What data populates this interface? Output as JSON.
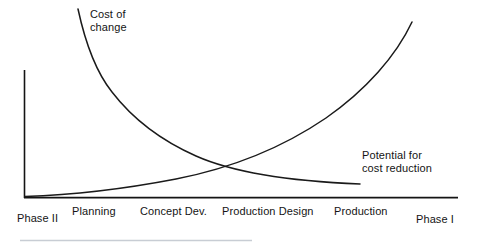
{
  "figure": {
    "width": 478,
    "height": 248,
    "background": "#ffffff",
    "line_color": "#1a1a1a",
    "axis_color": "#141414",
    "footer_rule_color": "#c8cdd4"
  },
  "annotations": {
    "cost_of_change": {
      "line1": "Cost of",
      "line2": "change"
    },
    "potential_cost_reduction": {
      "line1": "Potential for",
      "line2": "cost reduction"
    }
  },
  "axis": {
    "tick_labels": [
      {
        "label": "Phase II",
        "x": 17,
        "y": 212
      },
      {
        "label": "Planning",
        "x": 72,
        "y": 205
      },
      {
        "label": "Concept Dev.",
        "x": 140,
        "y": 205
      },
      {
        "label": "Production Design",
        "x": 222,
        "y": 205
      },
      {
        "label": "Production",
        "x": 334,
        "y": 205
      },
      {
        "label": "Phase I",
        "x": 416,
        "y": 213
      }
    ]
  },
  "chart_data": {
    "type": "line",
    "title": "",
    "subtitle": "",
    "xlabel": "",
    "ylabel": "",
    "grid": false,
    "legend": "inline-annotations",
    "xlim": [
      0,
      5
    ],
    "ylim": [
      0,
      1
    ],
    "categories": [
      "Phase II",
      "Planning",
      "Concept Dev.",
      "Production Design",
      "Production",
      "Phase I"
    ],
    "x": [
      0,
      1,
      2,
      3,
      4,
      5
    ],
    "series": [
      {
        "name": "Cost of change",
        "shape": "decaying-exponential",
        "description": "Starts very high at the left (Phase II) and decays convexly toward a low value at the right (Phase I).",
        "values": [
          1.48,
          0.72,
          0.42,
          0.26,
          0.15,
          0.1
        ],
        "annotation": "Cost of change",
        "color": "#1a1a1a"
      },
      {
        "name": "Potential for cost reduction",
        "shape": "growing-exponential",
        "description": "Starts near zero at the left (Phase II) and rises convexly to a very high value at the right (Phase I).",
        "values": [
          0.02,
          0.06,
          0.14,
          0.3,
          0.62,
          1.4
        ],
        "annotation": "Potential for cost reduction",
        "color": "#1a1a1a"
      }
    ],
    "intersection": {
      "label": "crossover",
      "x": 2.88,
      "y": 0.28
    }
  }
}
